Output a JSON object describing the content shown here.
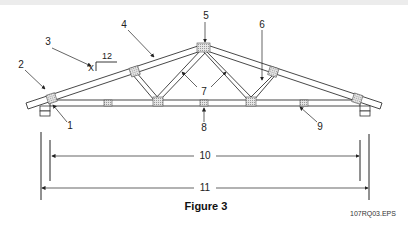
{
  "figure": {
    "title": "Figure 3",
    "file_id": "107RQ03.EPS"
  },
  "pitch": {
    "rise": "X",
    "run": "12"
  },
  "callouts": [
    {
      "id": "1",
      "x": 70,
      "y": 126
    },
    {
      "id": "2",
      "x": 21,
      "y": 65
    },
    {
      "id": "3",
      "x": 48,
      "y": 42
    },
    {
      "id": "4",
      "x": 124,
      "y": 25
    },
    {
      "id": "5",
      "x": 206,
      "y": 16
    },
    {
      "id": "6",
      "x": 262,
      "y": 25
    },
    {
      "id": "7",
      "x": 204,
      "y": 92
    },
    {
      "id": "8",
      "x": 204,
      "y": 128
    },
    {
      "id": "9",
      "x": 320,
      "y": 127
    },
    {
      "id": "10",
      "x": 204,
      "y": 156
    },
    {
      "id": "11",
      "x": 204,
      "y": 188
    }
  ],
  "labels": {
    "c1": "1",
    "c2": "2",
    "c3": "3",
    "c4": "4",
    "c5": "5",
    "c6": "6",
    "c7": "7",
    "c8": "8",
    "c9": "9",
    "c10": "10",
    "c11": "11"
  },
  "colors": {
    "line": "#333333",
    "plate": "#cfcfcf"
  }
}
